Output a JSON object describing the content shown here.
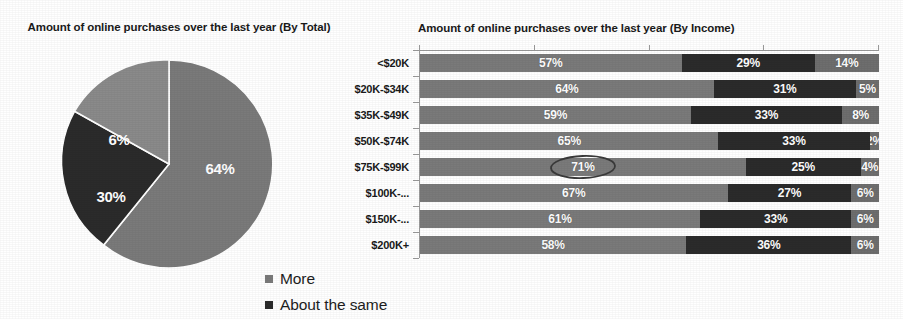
{
  "colors": {
    "series_more": "#7a7a7a",
    "series_about_same": "#2b2b2b",
    "series_less": "#6e6e6e",
    "axis": "#9a9a9a",
    "text": "#1a1a1a",
    "value_text": "#ffffff",
    "annotation": "#3a3a3a",
    "background": "#ffffff"
  },
  "legend": {
    "position": "bottom-center",
    "items": [
      {
        "label": "More",
        "color": "#7a7a7a",
        "swatch_icon": "square-swatch-icon"
      },
      {
        "label": "About the same",
        "color": "#2b2b2b",
        "swatch_icon": "square-swatch-icon"
      }
    ]
  },
  "chart_data": [
    {
      "id": "pie",
      "type": "pie",
      "title": "Amount of online purchases over the last year (By Total)",
      "xlabel": "",
      "ylabel": "",
      "grid": false,
      "legend_position": "bottom",
      "labels": [
        "More",
        "About the same",
        "Less"
      ],
      "values": [
        64,
        30,
        6
      ],
      "value_labels": [
        "64%",
        "30%",
        "6%"
      ],
      "colors": [
        "#7a7a7a",
        "#2b2b2b",
        "#8a8a8a"
      ],
      "start_angle_deg": 0,
      "direction": "clockwise"
    },
    {
      "id": "bar",
      "type": "bar",
      "orientation": "horizontal",
      "stacked": true,
      "stack_mode": "percent",
      "title": "Amount of online purchases over the last year (By Income)",
      "xlabel": "",
      "ylabel": "",
      "xlim": [
        0,
        100
      ],
      "xticks": [
        0,
        25,
        50,
        75,
        100
      ],
      "xtick_labels": [
        "",
        "",
        "",
        "",
        ""
      ],
      "grid": false,
      "legend_position": "bottom-left-of-figure",
      "categories": [
        "<$20K",
        "$20K-$34K",
        "$35K-$49K",
        "$50K-$74K",
        "$75K-$99K",
        "$100K-...",
        "$150K-...",
        "$200K+"
      ],
      "series": [
        {
          "name": "More",
          "color": "#7a7a7a",
          "values": [
            57,
            64,
            59,
            65,
            71,
            67,
            61,
            58
          ],
          "value_labels": [
            "57%",
            "64%",
            "59%",
            "65%",
            "71%",
            "67%",
            "61%",
            "58%"
          ]
        },
        {
          "name": "About the same",
          "color": "#2b2b2b",
          "values": [
            29,
            31,
            33,
            33,
            25,
            27,
            33,
            36
          ],
          "value_labels": [
            "29%",
            "31%",
            "33%",
            "33%",
            "25%",
            "27%",
            "33%",
            "36%"
          ]
        },
        {
          "name": "Less",
          "color": "#6e6e6e",
          "values": [
            14,
            5,
            8,
            2,
            4,
            6,
            6,
            6
          ],
          "value_labels": [
            "14%",
            "5%",
            "8%",
            "2%",
            "4%",
            "6%",
            "6%",
            "6%"
          ]
        }
      ],
      "annotations": [
        {
          "type": "ellipse",
          "target_category": "$75K-$99K",
          "target_series": "More",
          "target_value_label": "71%",
          "note": "hand-drawn oval highlighting 71%"
        }
      ]
    }
  ]
}
